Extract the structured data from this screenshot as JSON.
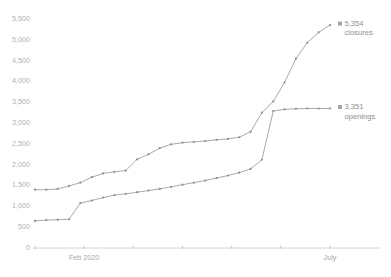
{
  "chart_data": {
    "type": "line",
    "title": "",
    "subtitle": "",
    "xlabel": "",
    "ylabel": "",
    "grid": false,
    "legend_position": "right-inline",
    "ylim": [
      0,
      5500
    ],
    "y_ticks": [
      0,
      500,
      1000,
      1500,
      2000,
      2500,
      3000,
      3500,
      4000,
      4500,
      5000,
      5500
    ],
    "y_tick_labels": [
      "0",
      "500",
      "1,000",
      "1,500",
      "2,000",
      "2,500",
      "3,000",
      "3,500",
      "4,000",
      "4,500",
      "5,000",
      "5,500"
    ],
    "x_tick_labels": [
      "",
      "Feb 2020",
      "",
      "",
      "",
      "",
      "July"
    ],
    "x_tick_positions": [
      0,
      0.1667,
      0.3333,
      0.5,
      0.6667,
      0.8333,
      1.0
    ],
    "x_index_count": 26,
    "series": [
      {
        "name": "closures",
        "end_label_value": "5,354",
        "end_label_name": "closures",
        "color": "#9a9a9a",
        "values": [
          1400,
          1400,
          1420,
          1490,
          1570,
          1700,
          1790,
          1830,
          1860,
          2130,
          2250,
          2400,
          2490,
          2530,
          2550,
          2570,
          2600,
          2620,
          2660,
          2790,
          3250,
          3520,
          3980,
          4550,
          4930,
          5180,
          5354
        ]
      },
      {
        "name": "openings",
        "end_label_value": "3,351",
        "end_label_name": "openings",
        "color": "#9a9a9a",
        "values": [
          650,
          670,
          680,
          690,
          1080,
          1140,
          1210,
          1270,
          1300,
          1340,
          1380,
          1420,
          1470,
          1520,
          1570,
          1620,
          1680,
          1740,
          1810,
          1900,
          2120,
          3290,
          3330,
          3345,
          3350,
          3351,
          3351
        ]
      }
    ]
  },
  "legend": {
    "items": [
      {
        "value": "5,354",
        "name": "closures"
      },
      {
        "value": "3,351",
        "name": "openings"
      }
    ]
  }
}
